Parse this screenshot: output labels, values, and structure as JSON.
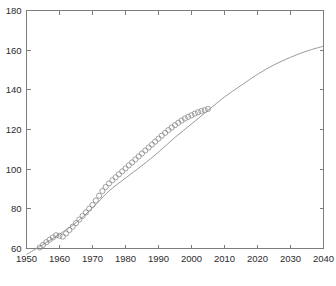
{
  "figure": {
    "background": "#ffffff",
    "axis_color": "#7d7d7d",
    "line_color": "#8f8f8f",
    "marker_color": "#8a8a8a",
    "caption": ""
  },
  "chart_data": {
    "type": "line",
    "title": "",
    "xlabel": "",
    "ylabel": "",
    "xlim": [
      1950,
      2040
    ],
    "ylim": [
      60,
      180
    ],
    "xticks": [
      1950,
      1960,
      1970,
      1980,
      1990,
      2000,
      2010,
      2020,
      2030,
      2040
    ],
    "yticks": [
      60,
      80,
      100,
      120,
      140,
      160,
      180
    ],
    "grid": false,
    "legend": null,
    "series": [
      {
        "name": "observed",
        "marker": "circle",
        "linestyle": "none",
        "x": [
          1954,
          1955,
          1956,
          1957,
          1958,
          1959,
          1960,
          1961,
          1962,
          1963,
          1964,
          1965,
          1966,
          1967,
          1968,
          1969,
          1970,
          1971,
          1972,
          1973,
          1974,
          1975,
          1976,
          1977,
          1978,
          1979,
          1980,
          1981,
          1982,
          1983,
          1984,
          1985,
          1986,
          1987,
          1988,
          1989,
          1990,
          1991,
          1992,
          1993,
          1994,
          1995,
          1996,
          1997,
          1998,
          1999,
          2000,
          2001,
          2002,
          2003,
          2004,
          2005
        ],
        "y": [
          60.5,
          61.8,
          63.2,
          64.4,
          65.6,
          66.7,
          66.4,
          66.0,
          67.6,
          69.3,
          71.0,
          72.8,
          74.6,
          76.4,
          78.2,
          80.1,
          82.0,
          84.2,
          86.6,
          89.0,
          91.0,
          92.8,
          94.4,
          95.9,
          97.4,
          98.9,
          100.4,
          101.9,
          103.4,
          104.9,
          106.4,
          107.9,
          109.4,
          110.9,
          112.4,
          113.9,
          115.4,
          116.9,
          118.3,
          119.7,
          121.0,
          122.2,
          123.4,
          124.5,
          125.5,
          126.4,
          127.2,
          128.0,
          128.7,
          129.3,
          129.8,
          130.4
        ]
      },
      {
        "name": "fitted-projection",
        "marker": "none",
        "linestyle": "solid",
        "x": [
          1950,
          1955,
          1960,
          1965,
          1970,
          1975,
          1980,
          1985,
          1990,
          1995,
          2000,
          2005,
          2010,
          2015,
          2020,
          2025,
          2030,
          2035,
          2040
        ],
        "y": [
          57.0,
          62.0,
          67.2,
          73.0,
          80.5,
          89.0,
          95.5,
          101.8,
          108.6,
          116.0,
          122.8,
          129.6,
          136.4,
          142.2,
          147.8,
          152.6,
          156.4,
          159.6,
          162.0
        ]
      }
    ]
  },
  "axis_labels": {
    "x": [
      "1950",
      "1960",
      "1970",
      "1980",
      "1990",
      "2000",
      "2010",
      "2020",
      "2030",
      "2040"
    ],
    "y": [
      "60",
      "80",
      "100",
      "120",
      "140",
      "160",
      "180"
    ]
  }
}
